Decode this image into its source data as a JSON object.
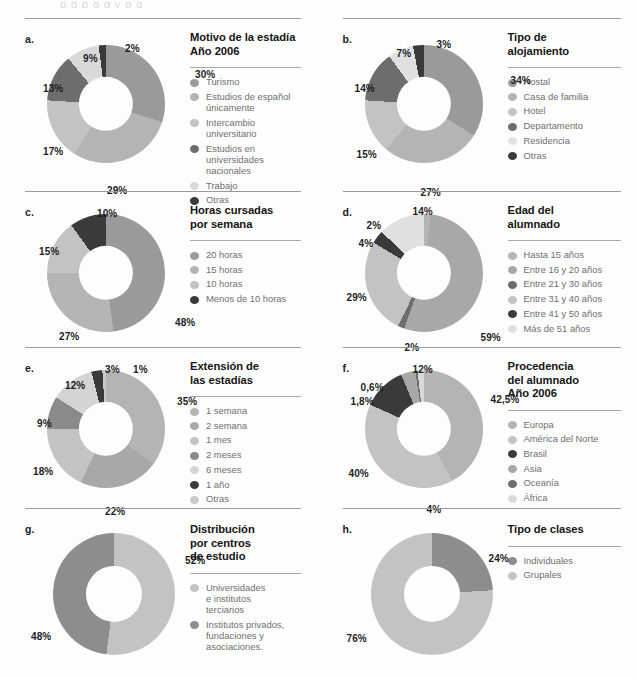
{
  "top_bleed_text": "p  g      p g  g   y p          g",
  "palette": {
    "mid_gray": "#9a9a9a",
    "light_gray": "#c3c3c3",
    "lighter_gray": "#b4b4b4",
    "dark_gray": "#6d6d6d",
    "pale_gray": "#dcdcdc",
    "near_black": "#3a3a3a",
    "very_light": "#e3e3e3"
  },
  "charts": [
    {
      "letter": "a.",
      "title": "Motivo de la estadía\nAño 2006",
      "chart_data": {
        "type": "pie",
        "title": "Motivo de la estadía Año 2006",
        "categories": [
          "Turismo",
          "Estudios de español únicamente",
          "Intercambio universitario",
          "Estudios en universidades nacionales",
          "Trabajo",
          "Otras"
        ],
        "values": [
          30,
          29,
          17,
          13,
          9,
          2
        ],
        "value_labels": [
          "30%",
          "29%",
          "17%",
          "13%",
          "9%",
          "2%"
        ],
        "colors": [
          "#9a9a9a",
          "#b4b4b4",
          "#c3c3c3",
          "#6d6d6d",
          "#d9d9d9",
          "#3a3a3a"
        ],
        "legend_position": "right"
      },
      "label_positions": [
        {
          "text": "30%",
          "x": 148,
          "y": 24,
          "align": "left"
        },
        {
          "text": "29%",
          "x": 60,
          "y": 140,
          "align": "left"
        },
        {
          "text": "17%",
          "x": -4,
          "y": 101,
          "align": "left"
        },
        {
          "text": "13%",
          "x": -4,
          "y": 38,
          "align": "left"
        },
        {
          "text": "9%",
          "x": 36,
          "y": 8,
          "align": "left"
        },
        {
          "text": "2%",
          "x": 78,
          "y": -2,
          "align": "left"
        }
      ]
    },
    {
      "letter": "b.",
      "title": "Tipo de\nalojamiento",
      "chart_data": {
        "type": "pie",
        "title": "Tipo de alojamiento",
        "categories": [
          "Hostal",
          "Casa de familia",
          "Hotel",
          "Departamento",
          "Residencia",
          "Otras"
        ],
        "values": [
          34,
          27,
          15,
          14,
          7,
          3
        ],
        "value_labels": [
          "34%",
          "27%",
          "15%",
          "14%",
          "7%",
          "3%"
        ],
        "colors": [
          "#9a9a9a",
          "#b4b4b4",
          "#c3c3c3",
          "#6d6d6d",
          "#e0e0e0",
          "#3a3a3a"
        ],
        "legend_position": "right"
      },
      "label_positions": [
        {
          "text": "34%",
          "x": 146,
          "y": 30,
          "align": "left"
        },
        {
          "text": "27%",
          "x": 56,
          "y": 142,
          "align": "left"
        },
        {
          "text": "15%",
          "x": -8,
          "y": 104,
          "align": "left"
        },
        {
          "text": "14%",
          "x": -10,
          "y": 38,
          "align": "left"
        },
        {
          "text": "7%",
          "x": 32,
          "y": 3,
          "align": "left"
        },
        {
          "text": "3%",
          "x": 72,
          "y": -6,
          "align": "left"
        }
      ]
    },
    {
      "letter": "c.",
      "title": "Horas cursadas\npor semana",
      "chart_data": {
        "type": "pie",
        "title": "Horas cursadas por semana",
        "categories": [
          "20 horas",
          "15 horas",
          "10 horas",
          "Menos de 10 horas"
        ],
        "values": [
          48,
          27,
          15,
          10
        ],
        "value_labels": [
          "48%",
          "27%",
          "15%",
          "10%"
        ],
        "colors": [
          "#9a9a9a",
          "#b4b4b4",
          "#c3c3c3",
          "#3a3a3a"
        ],
        "legend_position": "right"
      },
      "label_positions": [
        {
          "text": "48%",
          "x": 128,
          "y": 103,
          "align": "left"
        },
        {
          "text": "27%",
          "x": 12,
          "y": 117,
          "align": "left"
        },
        {
          "text": "15%",
          "x": -8,
          "y": 32,
          "align": "left"
        },
        {
          "text": "10%",
          "x": 50,
          "y": -6,
          "align": "left"
        }
      ]
    },
    {
      "letter": "d.",
      "title": "Edad del\nalumnado",
      "chart_data": {
        "type": "pie",
        "title": "Edad del alumnado",
        "categories": [
          "Hasta 15 años",
          "Entre 16 y 20 años",
          "Entre 21 y 30 años",
          "Entre 31 y 40 años",
          "Entre 41 y 50 años",
          "Más de 51 años"
        ],
        "values": [
          2,
          59,
          2,
          29,
          4,
          14
        ],
        "value_labels": [
          "59%",
          "29%",
          "14%",
          "4%",
          "2%",
          "2%"
        ],
        "colors": [
          "#b4b4b4",
          "#a8a8a8",
          "#6d6d6d",
          "#c3c3c3",
          "#3a3a3a",
          "#e0e0e0"
        ],
        "legend_position": "right"
      },
      "label_positions": [
        {
          "text": "59%",
          "x": 116,
          "y": 118,
          "align": "left"
        },
        {
          "text": "29%",
          "x": -18,
          "y": 78,
          "align": "left"
        },
        {
          "text": "14%",
          "x": 48,
          "y": -8,
          "align": "left"
        },
        {
          "text": "4%",
          "x": -6,
          "y": 24,
          "align": "left"
        },
        {
          "text": "2%",
          "x": 2,
          "y": 6,
          "align": "left"
        },
        {
          "text": "2%",
          "x": 40,
          "y": 128,
          "align": "left"
        }
      ]
    },
    {
      "letter": "e.",
      "title": "Extensión de\nlas estadías",
      "chart_data": {
        "type": "pie",
        "title": "Extensión de las estadías",
        "categories": [
          "1 semana",
          "2 semana",
          "1 mes",
          "2 meses",
          "6 meses",
          "1 año",
          "Otras"
        ],
        "values": [
          35,
          22,
          18,
          9,
          12,
          3,
          1
        ],
        "value_labels": [
          "35%",
          "22%",
          "18%",
          "9%",
          "12%",
          "3%",
          "1%"
        ],
        "colors": [
          "#b4b4b4",
          "#a8a8a8",
          "#c3c3c3",
          "#8a8a8a",
          "#d4d4d4",
          "#3a3a3a",
          "#c9c9c9"
        ],
        "legend_position": "right"
      },
      "label_positions": [
        {
          "text": "35%",
          "x": 130,
          "y": 26,
          "align": "left"
        },
        {
          "text": "22%",
          "x": 58,
          "y": 136,
          "align": "left"
        },
        {
          "text": "18%",
          "x": -14,
          "y": 96,
          "align": "left"
        },
        {
          "text": "9%",
          "x": -10,
          "y": 48,
          "align": "left"
        },
        {
          "text": "12%",
          "x": 18,
          "y": 10,
          "align": "left"
        },
        {
          "text": "3%",
          "x": 58,
          "y": -6,
          "align": "left"
        },
        {
          "text": "1%",
          "x": 86,
          "y": -6,
          "align": "left"
        }
      ]
    },
    {
      "letter": "f.",
      "title": "Procedencia\ndel alumnado\nAño 2006",
      "chart_data": {
        "type": "pie",
        "title": "Procedencia del alumnado Año 2006",
        "categories": [
          "Europa",
          "América del Norte",
          "Brasil",
          "Asia",
          "Oceanía",
          "África"
        ],
        "values": [
          42.5,
          40,
          12,
          4,
          0.6,
          1.8
        ],
        "value_labels": [
          "42,5%",
          "40%",
          "12%",
          "4%",
          "0,6%",
          "1,8%"
        ],
        "colors": [
          "#b4b4b4",
          "#c3c3c3",
          "#3a3a3a",
          "#a8a8a8",
          "#6d6d6d",
          "#d9d9d9"
        ],
        "legend_position": "right"
      },
      "label_positions": [
        {
          "text": "42,5%",
          "x": 126,
          "y": 24,
          "align": "left"
        },
        {
          "text": "40%",
          "x": -16,
          "y": 98,
          "align": "left"
        },
        {
          "text": "12%",
          "x": 48,
          "y": -6,
          "align": "left"
        },
        {
          "text": "4%",
          "x": 62,
          "y": 134,
          "align": "left"
        },
        {
          "text": "0,6%",
          "x": -4,
          "y": 12,
          "align": "left"
        },
        {
          "text": "1,8%",
          "x": -14,
          "y": 26,
          "align": "left"
        }
      ]
    },
    {
      "letter": "g.",
      "title": "Distribución\npor centros\nde estudio",
      "chart_data": {
        "type": "pie",
        "title": "Distribución por centros de estudio",
        "categories": [
          "Universidades e institutos terciarios",
          "Institutos privados, fundaciones y asociaciones."
        ],
        "values": [
          52,
          48
        ],
        "value_labels": [
          "52%",
          "48%"
        ],
        "colors": [
          "#c3c3c3",
          "#8d8d8d"
        ],
        "legend_position": "right"
      },
      "legend_labels": [
        "Universidades\ne institutos\nterciarios",
        "Institutos privados,\nfundaciones y\nasociaciones."
      ],
      "label_positions": [
        {
          "text": "52%",
          "x": 132,
          "y": 22,
          "align": "left"
        },
        {
          "text": "48%",
          "x": -22,
          "y": 98,
          "align": "left"
        }
      ]
    },
    {
      "letter": "h.",
      "title": "Tipo de clases",
      "chart_data": {
        "type": "pie",
        "title": "Tipo de clases",
        "categories": [
          "Individuales",
          "Grupales"
        ],
        "values": [
          24,
          76
        ],
        "value_labels": [
          "24%",
          "76%"
        ],
        "colors": [
          "#8d8d8d",
          "#c3c3c3"
        ],
        "legend_position": "right"
      },
      "label_positions": [
        {
          "text": "24%",
          "x": 118,
          "y": 20,
          "align": "left"
        },
        {
          "text": "76%",
          "x": -24,
          "y": 100,
          "align": "left"
        }
      ]
    }
  ]
}
